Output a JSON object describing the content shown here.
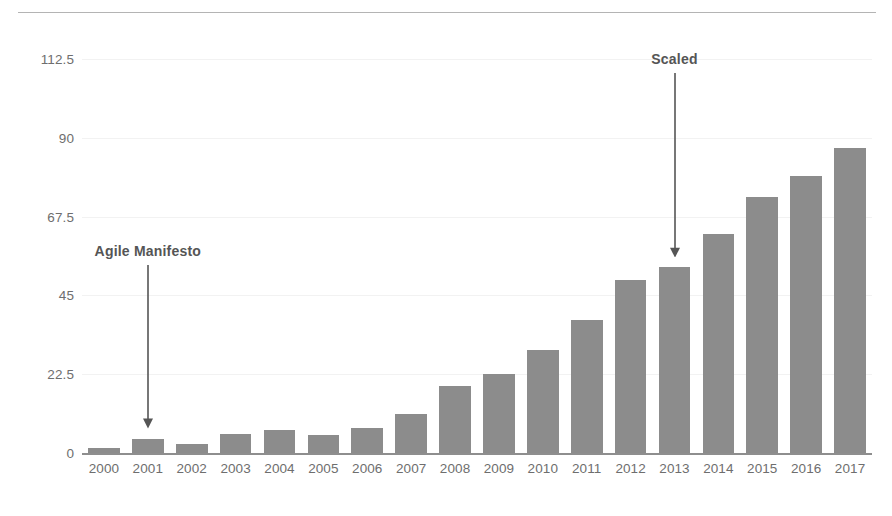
{
  "chart_data": {
    "type": "bar",
    "title": "",
    "subtitle": "",
    "xlabel": "",
    "ylabel": "",
    "categories": [
      "2000",
      "2001",
      "2002",
      "2003",
      "2004",
      "2005",
      "2006",
      "2007",
      "2008",
      "2009",
      "2010",
      "2011",
      "2012",
      "2013",
      "2014",
      "2015",
      "2016",
      "2017"
    ],
    "values": [
      1.5,
      4,
      2.5,
      5.5,
      6.5,
      5,
      7,
      11,
      19,
      22.5,
      29.5,
      38,
      49.5,
      53,
      62.5,
      73,
      79,
      87
    ],
    "series": [
      {
        "name": "",
        "values": [
          1.5,
          4,
          2.5,
          5.5,
          6.5,
          5,
          7,
          11,
          19,
          22.5,
          29.5,
          38,
          49.5,
          53,
          62.5,
          73,
          79,
          87
        ]
      }
    ],
    "ylim": [
      0,
      112.5
    ],
    "yticks": [
      0,
      22.5,
      45,
      67.5,
      90,
      112.5
    ],
    "ytick_labels": [
      "0",
      "22.5",
      "45",
      "67.5",
      "90",
      "112.5"
    ],
    "xtick_labels": [
      "2000",
      "2001",
      "2002",
      "2003",
      "2004",
      "2005",
      "2006",
      "2007",
      "2008",
      "2009",
      "2010",
      "2011",
      "2012",
      "2013",
      "2014",
      "2015",
      "2016",
      "2017"
    ],
    "grid": true,
    "legend": null,
    "legend_position": "none",
    "bar_color": "#8c8c8c",
    "axis_color": "#8e8e8e",
    "grid_color": "#f2f2f2",
    "text_color": "#6e6e6e",
    "annotations": [
      {
        "text": "Agile Manifesto",
        "target_category": "2001",
        "target_value": 4,
        "label_value": 57,
        "arrow": "down"
      },
      {
        "text": "Scaled",
        "target_category": "2013",
        "target_value": 53,
        "label_value": 112,
        "arrow": "down"
      }
    ]
  },
  "figure": {
    "top_rule": true,
    "background": "#ffffff"
  }
}
